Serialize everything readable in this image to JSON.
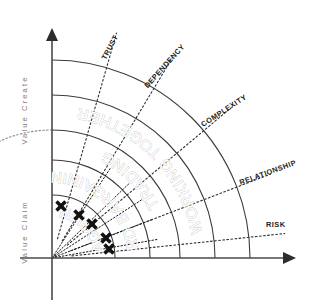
{
  "diagram": {
    "origin": {
      "x": 52,
      "y": 258
    },
    "axes": {
      "vertical": {
        "upper_label": "Value Create",
        "lower_label": "Value Claim",
        "x": 52,
        "top": 28,
        "bottom": 300
      },
      "horizontal": {
        "y": 258,
        "left": 20,
        "right": 296
      }
    },
    "bands": [
      {
        "label": "HAGGLING",
        "radius": 63,
        "text_angle": -44,
        "text_radius": 52
      },
      {
        "label": "HARD BARGAINING",
        "radius": 98,
        "text_angle": -42,
        "text_radius": 86
      },
      {
        "label": "TRADING",
        "radius": 128,
        "text_angle": -52,
        "text_radius": 119
      },
      {
        "label": "WORKING TOGETHER",
        "radius": 163,
        "text_angle": -58,
        "text_radius": 152
      },
      {
        "label": "",
        "radius": 198,
        "text_angle": 0,
        "text_radius": 0
      }
    ],
    "outer_radius": 198,
    "dotted_arc_radius": 128,
    "rays": [
      {
        "label": "TRUST",
        "angle": 74,
        "label_angle": 74,
        "label_radius": 218,
        "text_rotation": -62
      },
      {
        "label": "DEPENDENCY",
        "angle": 59,
        "label_angle": 59,
        "label_radius": 222,
        "text_rotation": -48
      },
      {
        "label": "COMPLEXITY",
        "angle": 40,
        "label_angle": 40,
        "label_radius": 226,
        "text_rotation": -33
      },
      {
        "label": "RELATIONSHIP",
        "angle": 21,
        "label_angle": 21,
        "label_radius": 232,
        "text_rotation": -20
      },
      {
        "label": "RISK",
        "angle": 6,
        "label_angle": 8,
        "label_radius": 226,
        "text_rotation": 0
      }
    ],
    "plot_rays": [
      {
        "angle": 57
      },
      {
        "angle": 44
      },
      {
        "angle": 33
      },
      {
        "angle": 21
      },
      {
        "angle": 10
      }
    ],
    "markers": [
      {
        "x": 61,
        "y": 206,
        "size": 9
      },
      {
        "x": 79,
        "y": 215,
        "size": 9
      },
      {
        "x": 92,
        "y": 224,
        "size": 9
      },
      {
        "x": 106,
        "y": 238,
        "size": 9
      },
      {
        "x": 109,
        "y": 249,
        "size": 9
      }
    ],
    "colors": {
      "axis": "#4a4a4a",
      "arc": "#3c3c3c",
      "band_text": "#b9b9b9",
      "ray_text": "#232323",
      "axis_text": "#7d7d7d",
      "marker": "#111111",
      "background": "#ffffff"
    }
  }
}
